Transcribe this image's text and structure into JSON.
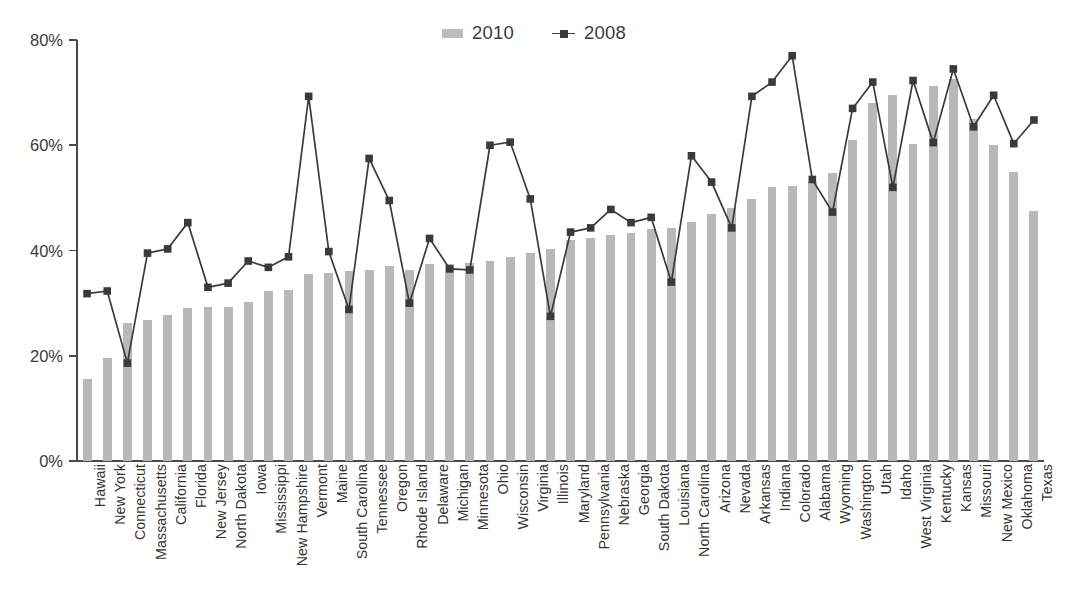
{
  "legend": {
    "position": "top-center",
    "entries": [
      {
        "label": "2010",
        "type": "bar",
        "color": "#b8b8b8",
        "icon": "bar-swatch-icon"
      },
      {
        "label": "2008",
        "type": "line",
        "color": "#3a3a3a",
        "icon": "line-marker-swatch-icon"
      }
    ]
  },
  "chart_data": {
    "type": "bar",
    "title": "",
    "subtitle": "",
    "xlabel": "",
    "ylabel": "",
    "ylim": [
      0,
      80
    ],
    "y_tick_labels": [
      "0%",
      "20%",
      "40%",
      "60%",
      "80%"
    ],
    "y_ticks": [
      0,
      20,
      40,
      60,
      80
    ],
    "grid": false,
    "legend_position": "top-center",
    "categories": [
      "Hawaii",
      "New York",
      "Connecticut",
      "Massachusetts",
      "California",
      "Florida",
      "New Jersey",
      "North Dakota",
      "Iowa",
      "Mississippi",
      "New Hampshire",
      "Vermont",
      "Maine",
      "South Carolina",
      "Tennessee",
      "Oregon",
      "Rhode Island",
      "Delaware",
      "Michigan",
      "Minnesota",
      "Ohio",
      "Wisconsin",
      "Virginia",
      "Illinois",
      "Maryland",
      "Pennsylvania",
      "Nebraska",
      "Georgia",
      "South Dakota",
      "Louisiana",
      "North Carolina",
      "Arizona",
      "Nevada",
      "Arkansas",
      "Indiana",
      "Colorado",
      "Alabama",
      "Wyoming",
      "Washington",
      "Utah",
      "Idaho",
      "West Virginia",
      "Kentucky",
      "Kansas",
      "Missouri",
      "New Mexico",
      "Oklahoma",
      "Texas"
    ],
    "series": [
      {
        "name": "2010",
        "type": "bar",
        "color": "#b8b8b8",
        "values": [
          15.5,
          19.5,
          26.3,
          26.8,
          27.8,
          29.0,
          29.3,
          29.3,
          30.2,
          32.3,
          32.5,
          35.5,
          35.8,
          36.2,
          36.3,
          37.0,
          36.3,
          37.5,
          37.5,
          37.6,
          38.0,
          38.8,
          39.5,
          40.3,
          42.0,
          42.3,
          43.0,
          43.3,
          44.0,
          44.2,
          45.5,
          47.0,
          48.0,
          49.8,
          52.0,
          52.3,
          53.0,
          54.8,
          61.0,
          68.0,
          69.5,
          60.3,
          71.3,
          72.5,
          65.0,
          60.0,
          55.0,
          47.5
        ]
      },
      {
        "name": "2008",
        "type": "line",
        "color": "#3a3a3a",
        "marker": "square",
        "values": [
          31.8,
          32.3,
          18.6,
          39.5,
          40.3,
          45.3,
          33.0,
          33.8,
          38.0,
          36.8,
          38.8,
          69.3,
          39.8,
          28.8,
          57.5,
          49.5,
          30.0,
          42.3,
          36.5,
          36.3,
          60.0,
          60.6,
          49.8,
          27.5,
          43.5,
          44.3,
          47.8,
          45.3,
          46.3,
          34.0,
          58.0,
          53.0,
          44.3,
          69.3,
          72.0,
          77.0,
          53.5,
          47.3,
          67.0,
          72.0,
          52.0,
          72.3,
          60.5,
          74.5,
          63.5,
          69.5,
          60.3,
          64.8
        ]
      }
    ]
  }
}
